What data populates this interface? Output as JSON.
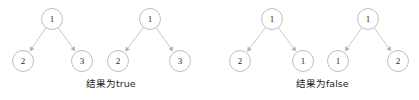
{
  "figure": {
    "background_color": "#ffffff",
    "node_stroke_color": "#b6b6bd",
    "node_fill_color": "#ffffff",
    "edge_color": "#c3c3c9",
    "label_color": "#2a2a2a",
    "caption_color": "#232323",
    "width": 419,
    "height": 100
  },
  "groups": [
    {
      "id": "group-true",
      "caption": "结果为true",
      "trees": [
        {
          "id": "tree-1",
          "root": {
            "label": "1",
            "cx": 52,
            "cy": 19,
            "r": 10.5
          },
          "left": {
            "label": "2",
            "cx": 23,
            "cy": 61,
            "r": 10.5
          },
          "right": {
            "label": "3",
            "cx": 82,
            "cy": 61,
            "r": 10.5
          }
        },
        {
          "id": "tree-2",
          "root": {
            "label": "1",
            "cx": 150,
            "cy": 19,
            "r": 10.5
          },
          "left": {
            "label": "2",
            "cx": 118,
            "cy": 61,
            "r": 10.5
          },
          "right": {
            "label": "3",
            "cx": 180,
            "cy": 61,
            "r": 10.5
          }
        }
      ]
    },
    {
      "id": "group-false",
      "caption": "结果为false",
      "trees": [
        {
          "id": "tree-3",
          "root": {
            "label": "1",
            "cx": 272,
            "cy": 19,
            "r": 10.5
          },
          "left": {
            "label": "2",
            "cx": 240,
            "cy": 61,
            "r": 10.5
          },
          "right": {
            "label": "1",
            "cx": 303,
            "cy": 61,
            "r": 10.5
          }
        },
        {
          "id": "tree-4",
          "root": {
            "label": "1",
            "cx": 368,
            "cy": 19,
            "r": 10.5
          },
          "left": {
            "label": "1",
            "cx": 338,
            "cy": 61,
            "r": 10.5
          },
          "right": {
            "label": "2",
            "cx": 398,
            "cy": 61,
            "r": 10.5
          }
        }
      ]
    }
  ]
}
